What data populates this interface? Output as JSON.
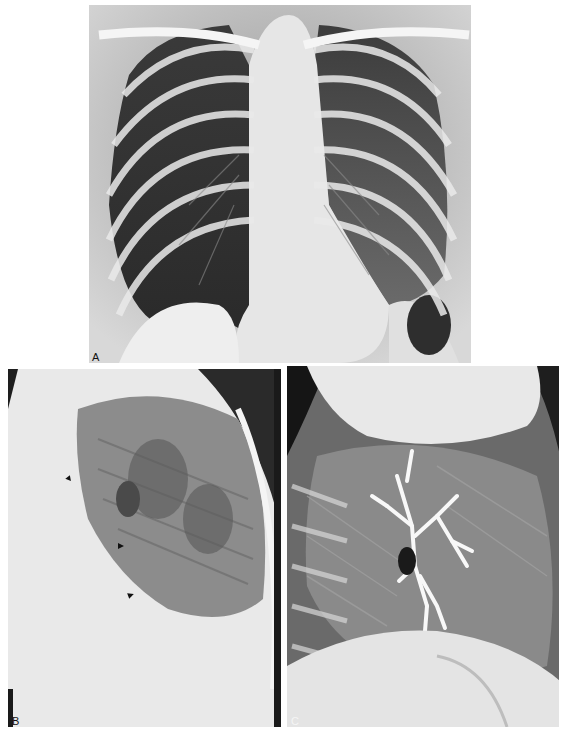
{
  "figure": {
    "panels": [
      {
        "id": "A",
        "label": "A",
        "view": "frontal chest radiograph"
      },
      {
        "id": "B",
        "label": "B",
        "view": "lateral chest radiograph with arrowheads"
      },
      {
        "id": "C",
        "label": "C",
        "view": "lateral chest radiograph with contrast-filled bronchial tree"
      }
    ],
    "annotations": {
      "panel_b_arrowheads": 3
    },
    "colors": {
      "background": "#ffffff",
      "film_dark": "#1a1a1a",
      "bone_white": "#f2f2f2",
      "lung_gray": "#6e6e6e"
    }
  }
}
